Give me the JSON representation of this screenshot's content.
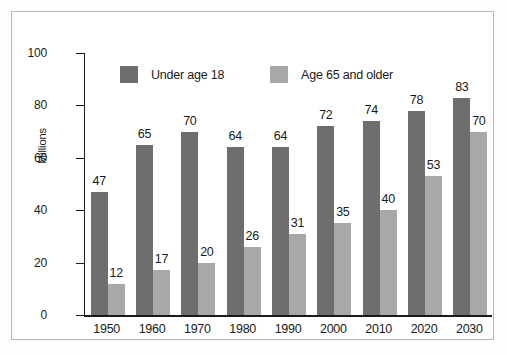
{
  "chart_data": {
    "type": "bar",
    "title": "",
    "xlabel": "",
    "ylabel": "Millions",
    "ylim": [
      0,
      100
    ],
    "yticks": [
      0,
      20,
      40,
      60,
      80,
      100
    ],
    "grid": false,
    "legend_position": "top-inside",
    "categories": [
      "1950",
      "1960",
      "1970",
      "1980",
      "1990",
      "2000",
      "2010",
      "2020",
      "2030"
    ],
    "series": [
      {
        "name": "Under age 18",
        "color": "#6e6e6e",
        "values": [
          47,
          65,
          70,
          64,
          64,
          72,
          74,
          78,
          83
        ]
      },
      {
        "name": "Age 65 and older",
        "color": "#a8a8a8",
        "values": [
          12,
          17,
          20,
          26,
          31,
          35,
          40,
          53,
          70
        ]
      }
    ]
  },
  "colors": {
    "series_dark": "#6e6e6e",
    "series_light": "#a8a8a8",
    "axis": "#1a1a1a",
    "frame": "#b9b9b9",
    "background": "#ffffff"
  }
}
